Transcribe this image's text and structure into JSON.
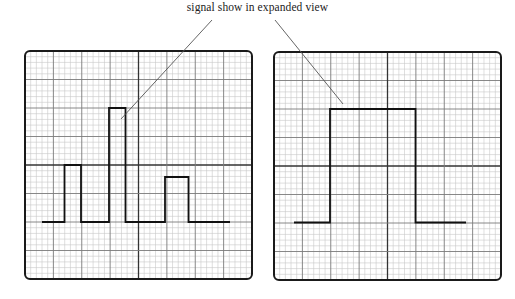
{
  "annotation": {
    "label": "signal show in expanded view",
    "pointer_line_color": "#555555"
  },
  "panels": [
    {
      "id": "overview",
      "x": 25,
      "y": 51,
      "width": 227,
      "height": 228,
      "major_divisions": 8,
      "minor_per_major": 5,
      "signal": {
        "baseline_y": 222,
        "points": [
          [
            42,
            222
          ],
          [
            64.5,
            222
          ],
          [
            64.5,
            165
          ],
          [
            81,
            165
          ],
          [
            81,
            222
          ],
          [
            109,
            222
          ],
          [
            109,
            108
          ],
          [
            125.5,
            108
          ],
          [
            125.5,
            222
          ],
          [
            165,
            222
          ],
          [
            165,
            177
          ],
          [
            188.5,
            177
          ],
          [
            188.5,
            222
          ],
          [
            230,
            222
          ]
        ]
      },
      "pointer_end": [
        121,
        119
      ]
    },
    {
      "id": "expanded",
      "x": 274,
      "y": 52,
      "width": 227,
      "height": 228,
      "major_divisions": 8,
      "minor_per_major": 5,
      "signal": {
        "baseline_y": 222.5,
        "points": [
          [
            294,
            222.5
          ],
          [
            330,
            222.5
          ],
          [
            330,
            109
          ],
          [
            415.5,
            109
          ],
          [
            415.5,
            222.5
          ],
          [
            466,
            222.5
          ]
        ]
      },
      "pointer_end": [
        343,
        104
      ]
    }
  ],
  "pointer_starts": [
    [
      212,
      20
    ],
    [
      275,
      20
    ]
  ],
  "colors": {
    "frame": "#1a1a1a",
    "major_grid": "#7a7a7a",
    "minor_grid": "#c8c8c8",
    "center_grid": "#333333",
    "signal": "#111111"
  }
}
